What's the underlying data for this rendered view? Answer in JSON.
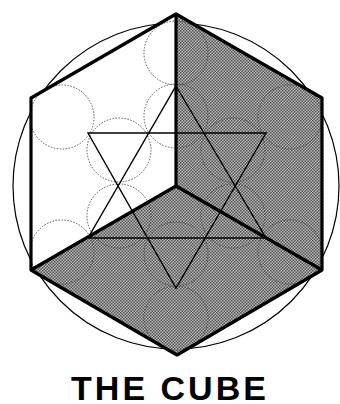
{
  "title": "THE CUBE",
  "colors": {
    "background": "#ffffff",
    "stroke": "#000000",
    "shaded_face": "#8a8a8a",
    "dark_face": "#7a7a7a"
  },
  "diagram": {
    "type": "geometric construction",
    "elements": [
      "outer circle",
      "hexagonal cube outline",
      "left face (white)",
      "right face (shaded)",
      "bottom face (shaded)",
      "hexagram (two interlocking triangles)",
      "dotted circles (fruit of life pattern)"
    ]
  }
}
